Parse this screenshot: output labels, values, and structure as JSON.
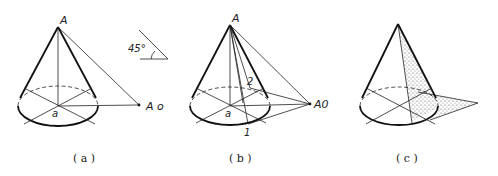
{
  "figure": {
    "panels": [
      {
        "id": "a",
        "caption": "( a )",
        "apex_label": "A",
        "base_center_label": "a",
        "shadow_point_label": "A o",
        "angle_symbol_label": "45°"
      },
      {
        "id": "b",
        "caption": "( b )",
        "apex_label": "A",
        "base_center_label": "a",
        "shadow_point_label": "A0",
        "point_1_label": "1",
        "point_2_label": "2"
      },
      {
        "id": "c",
        "caption": "( c )"
      }
    ],
    "colors": {
      "line": "#222222",
      "shade": "#bdbdbd",
      "background": "#ffffff"
    }
  }
}
